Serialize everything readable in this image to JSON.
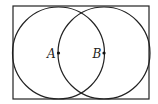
{
  "diagram": {
    "type": "geometry",
    "rectangle": {
      "x": 13,
      "y": 6,
      "width": 136,
      "height": 93
    },
    "circles": [
      {
        "center_label": "A",
        "cx": 58.5,
        "cy": 53,
        "r": 46
      },
      {
        "center_label": "B",
        "cx": 104,
        "cy": 53,
        "r": 46
      }
    ],
    "points": [
      {
        "label": "A",
        "x": 58.5,
        "y": 53
      },
      {
        "label": "B",
        "x": 104,
        "y": 53
      }
    ],
    "stroke_color": "#222222"
  }
}
